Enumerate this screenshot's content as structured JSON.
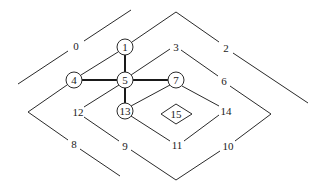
{
  "diagram": {
    "type": "contour-tree-graph",
    "colors": {
      "stroke": "#2a2a2a",
      "background": "#ffffff"
    },
    "circle_nodes": [
      {
        "id": "1",
        "label": "1",
        "x": 125,
        "y": 47
      },
      {
        "id": "4",
        "label": "4",
        "x": 74,
        "y": 80
      },
      {
        "id": "5",
        "label": "5",
        "x": 125,
        "y": 80
      },
      {
        "id": "7",
        "label": "7",
        "x": 176,
        "y": 80
      },
      {
        "id": "13",
        "label": "13",
        "x": 125,
        "y": 111
      }
    ],
    "diamond_node": {
      "id": "15",
      "label": "15",
      "x": 176,
      "y": 114
    },
    "edge_labels": [
      {
        "id": "0",
        "label": "0",
        "x": 76,
        "y": 46
      },
      {
        "id": "2",
        "label": "2",
        "x": 226,
        "y": 48
      },
      {
        "id": "3",
        "label": "3",
        "x": 176,
        "y": 47
      },
      {
        "id": "6",
        "label": "6",
        "x": 224,
        "y": 81
      },
      {
        "id": "8",
        "label": "8",
        "x": 74,
        "y": 144
      },
      {
        "id": "9",
        "label": "9",
        "x": 125,
        "y": 146
      },
      {
        "id": "10",
        "label": "10",
        "x": 228,
        "y": 146
      },
      {
        "id": "11",
        "label": "11",
        "x": 177,
        "y": 145
      },
      {
        "id": "12",
        "label": "12",
        "x": 78,
        "y": 112
      },
      {
        "id": "14",
        "label": "14",
        "x": 226,
        "y": 111
      }
    ],
    "bold_edges": [
      {
        "from": "1",
        "to": "5"
      },
      {
        "from": "4",
        "to": "5"
      },
      {
        "from": "5",
        "to": "7"
      },
      {
        "from": "5",
        "to": "13"
      }
    ]
  }
}
